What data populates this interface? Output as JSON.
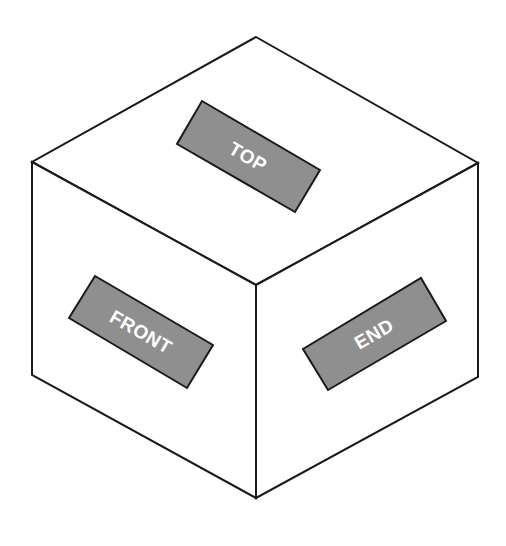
{
  "diagram": {
    "faces": [
      {
        "id": "top",
        "label": "TOP"
      },
      {
        "id": "front",
        "label": "FRONT"
      },
      {
        "id": "end",
        "label": "END"
      }
    ]
  },
  "colors": {
    "background": "#ffffff",
    "stroke": "#1a1a1a",
    "label_fill": "#8f8f8f",
    "label_text": "#ffffff"
  }
}
